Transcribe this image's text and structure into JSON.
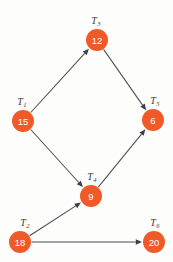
{
  "figure": {
    "background_color": "#fdfdfc",
    "node_color": "#f05a28",
    "node_value_color": "#ffffff",
    "label_color": "#3a3a3a",
    "edge_color": "#4a4d56"
  },
  "chart_data": {
    "type": "diagram",
    "diagram_kind": "directed-acyclic-graph",
    "title": "",
    "xlabel": "",
    "ylabel": "",
    "grid": false,
    "legend": "none",
    "node_radius": 11,
    "nodes": [
      {
        "id": "T1",
        "label": "T",
        "subscript": "1",
        "value": 15,
        "x": 23,
        "y": 121,
        "label_x": 22,
        "label_y": 101
      },
      {
        "id": "T2",
        "label": "T",
        "subscript": "2",
        "value": 18,
        "x": 20,
        "y": 242,
        "label_x": 25,
        "label_y": 222
      },
      {
        "id": "T3",
        "label": "T",
        "subscript": "3",
        "value": 12,
        "x": 97,
        "y": 40,
        "label_x": 96,
        "label_y": 20
      },
      {
        "id": "T4",
        "label": "T",
        "subscript": "4",
        "value": 9,
        "x": 91,
        "y": 196,
        "label_x": 92,
        "label_y": 176
      },
      {
        "id": "T5",
        "label": "T",
        "subscript": "5",
        "value": 6,
        "x": 153,
        "y": 120,
        "label_x": 155,
        "label_y": 100
      },
      {
        "id": "T6",
        "label": "T",
        "subscript": "6",
        "value": 20,
        "x": 154,
        "y": 242,
        "label_x": 155,
        "label_y": 222
      }
    ],
    "edges": [
      {
        "from": "T1",
        "to": "T3",
        "directed": true
      },
      {
        "from": "T1",
        "to": "T4",
        "directed": true
      },
      {
        "from": "T3",
        "to": "T5",
        "directed": true
      },
      {
        "from": "T4",
        "to": "T5",
        "directed": true
      },
      {
        "from": "T2",
        "to": "T4",
        "directed": true
      },
      {
        "from": "T2",
        "to": "T6",
        "directed": true
      }
    ],
    "node_values": [
      15,
      18,
      12,
      9,
      6,
      20
    ],
    "categories": [
      "T1",
      "T2",
      "T3",
      "T4",
      "T5",
      "T6"
    ],
    "values": [
      15,
      18,
      12,
      9,
      6,
      20
    ]
  }
}
